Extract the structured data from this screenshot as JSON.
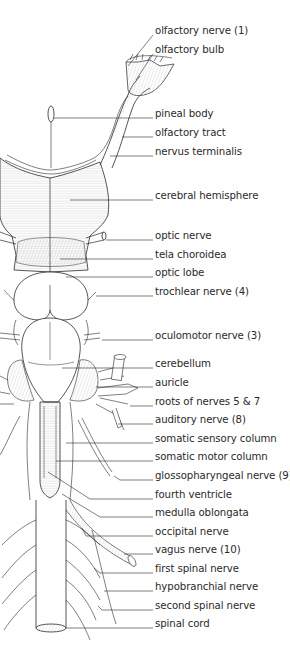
{
  "figure": {
    "colors": {
      "ink": "#2a2a2a",
      "shade": "#9a9a9a",
      "background": "#ffffff"
    }
  },
  "labels": [
    {
      "id": "olfactory-nerve",
      "text": "olfactory nerve (1)",
      "y": 31
    },
    {
      "id": "olfactory-bulb",
      "text": "olfactory bulb",
      "y": 50
    },
    {
      "id": "pineal-body",
      "text": "pineal body",
      "y": 114
    },
    {
      "id": "olfactory-tract",
      "text": "olfactory tract",
      "y": 133
    },
    {
      "id": "nervus-terminalis",
      "text": "nervus terminalis",
      "y": 152
    },
    {
      "id": "cerebral-hemisphere",
      "text": "cerebral hemisphere",
      "y": 196
    },
    {
      "id": "optic-nerve",
      "text": "optic nerve",
      "y": 236
    },
    {
      "id": "tela-choroidea",
      "text": "tela choroidea",
      "y": 255
    },
    {
      "id": "optic-lobe",
      "text": "optic lobe",
      "y": 273
    },
    {
      "id": "trochlear-nerve",
      "text": "trochlear nerve (4)",
      "y": 292
    },
    {
      "id": "oculomotor-nerve",
      "text": "oculomotor nerve (3)",
      "y": 336
    },
    {
      "id": "cerebellum",
      "text": "cerebellum",
      "y": 364
    },
    {
      "id": "auricle",
      "text": "auricle",
      "y": 383
    },
    {
      "id": "roots-of-nerves-5-7",
      "text": "roots of nerves 5 & 7",
      "y": 402
    },
    {
      "id": "auditory-nerve",
      "text": "auditory nerve (8)",
      "y": 420
    },
    {
      "id": "somatic-sensory-column",
      "text": "somatic sensory column",
      "y": 439
    },
    {
      "id": "somatic-motor-column",
      "text": "somatic motor column",
      "y": 457
    },
    {
      "id": "glossopharyngeal-nerve",
      "text": "glossopharyngeal nerve (9)",
      "y": 476
    },
    {
      "id": "fourth-ventricle",
      "text": "fourth ventricle",
      "y": 495
    },
    {
      "id": "medulla-oblongata",
      "text": "medulla oblongata",
      "y": 513
    },
    {
      "id": "occipital-nerve",
      "text": "occipital nerve",
      "y": 532
    },
    {
      "id": "vagus-nerve",
      "text": "vagus nerve (10)",
      "y": 550
    },
    {
      "id": "first-spinal-nerve",
      "text": "first spinal nerve",
      "y": 569
    },
    {
      "id": "hypobranchial-nerve",
      "text": "hypobranchial nerve",
      "y": 587
    },
    {
      "id": "second-spinal-nerve",
      "text": "second spinal nerve",
      "y": 606
    },
    {
      "id": "spinal-cord",
      "text": "spinal cord",
      "y": 624
    }
  ]
}
